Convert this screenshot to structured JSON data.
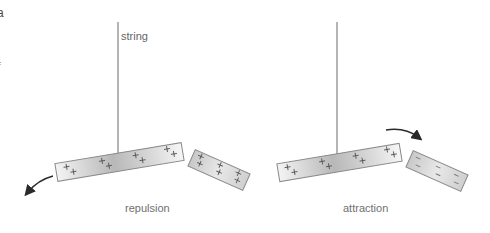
{
  "labels": {
    "string": "string",
    "left_caption": "repulsion",
    "right_caption": "attraction",
    "clipped_top": "a",
    "clipped_mid": "f"
  },
  "panels": [
    {
      "name": "repulsion",
      "hanging_rod": {
        "charges": [
          "+",
          "+",
          "+",
          "+",
          "+",
          "+",
          "+",
          "+"
        ]
      },
      "nearby_rod": {
        "charges": [
          "+",
          "+",
          "+",
          "+",
          "+",
          "+"
        ]
      },
      "arrow_direction": "down-left (away)"
    },
    {
      "name": "attraction",
      "hanging_rod": {
        "charges": [
          "+",
          "+",
          "+",
          "+",
          "+",
          "+",
          "+",
          "+"
        ]
      },
      "nearby_rod": {
        "charges": [
          "–",
          "–",
          "–",
          "–",
          "–",
          "–"
        ]
      },
      "arrow_direction": "down-right (toward)"
    }
  ],
  "colors": {
    "string": "#6a6a6a",
    "rod_border": "#8a8a8a",
    "rod_fill_light": "#f2f2f2",
    "rod_fill_dark": "#b9b9b9",
    "charge": "#555555",
    "arrow": "#2a2a2a",
    "caption": "#6f6f6f"
  }
}
